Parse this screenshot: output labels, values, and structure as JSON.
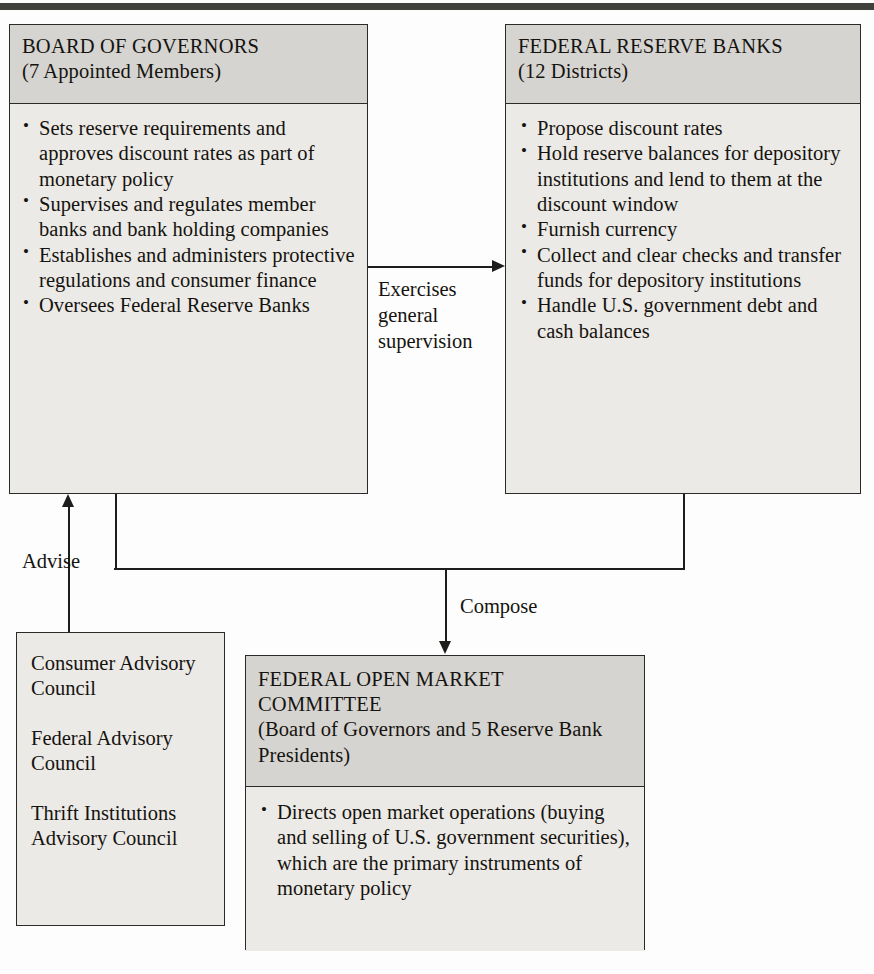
{
  "diagram": {
    "top_rule_color": "#40403c",
    "box_fill": "#eceae6",
    "header_fill": "#d6d4d0",
    "line_color": "#1d1d1b"
  },
  "board_of_governors": {
    "title": "BOARD OF GOVERNORS",
    "subtitle": "(7 Appointed Members)",
    "bullets": [
      "Sets reserve requirements and approves discount rates as part of monetary policy",
      "Supervises and regulates member banks and bank holding companies",
      "Establishes and administers protective regulations and consumer finance",
      "Oversees Federal Reserve Banks"
    ]
  },
  "federal_reserve_banks": {
    "title": "FEDERAL RESERVE BANKS",
    "subtitle": "(12 Districts)",
    "bullets": [
      "Propose discount rates",
      "Hold reserve balances for depository institutions and lend to them at the discount window",
      "Furnish currency",
      "Collect and clear checks and transfer funds for depository institutions",
      "Handle U.S. government debt and cash balances"
    ]
  },
  "advisory_councils": {
    "items": [
      "Consumer Advisory Council",
      "Federal Advisory Council",
      "Thrift Institutions Advisory Council"
    ]
  },
  "fomc": {
    "title_line1": "FEDERAL OPEN MARKET",
    "title_line2": "COMMITTEE",
    "subtitle": "(Board of Governors and 5 Reserve Bank Presidents)",
    "bullets": [
      "Directs open market operations (buying and selling of U.S. government securities), which are the primary instruments of monetary policy"
    ]
  },
  "edges": {
    "exercises_supervision": "Exercises\ngeneral\nsupervision",
    "advise": "Advise",
    "compose": "Compose"
  }
}
